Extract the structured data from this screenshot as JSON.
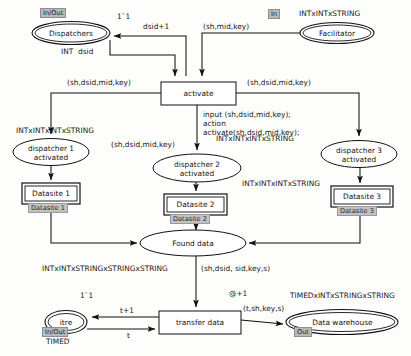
{
  "diagram": {
    "type": "colored-petri-net"
  },
  "places": [
    {
      "id": "dispatchers",
      "label": "Dispatchers",
      "port_tag": "In/Out",
      "color_set": "INT",
      "marking": "1`1",
      "variable": "dsid"
    },
    {
      "id": "facilitator",
      "label": "Facilitator",
      "port_tag": "In",
      "color_set": "INTxINTxSTRING"
    },
    {
      "id": "dispatcher1",
      "label": "dispatcher 1\nactivated",
      "color_set": "INTxINTxINTxSTRING"
    },
    {
      "id": "dispatcher2",
      "label": "dispatcher 2\nactivated",
      "color_set": "INTxINTxINTxSTRING"
    },
    {
      "id": "dispatcher3",
      "label": "dispatcher 3\nactivated",
      "color_set": "INTxINTxINTxSTRING"
    },
    {
      "id": "founddata",
      "label": "Found data",
      "color_set": "INTxINTxSTRINGxSTRINGxSTRING"
    },
    {
      "id": "itre",
      "label": "itre",
      "port_tag": "In/Out",
      "color_set": "TIMED",
      "marking": "1`1"
    },
    {
      "id": "warehouse",
      "label": "Data warehouse",
      "port_tag": "Out",
      "color_set": "TIMEDxINTxSTRINGxSTRING"
    }
  ],
  "transitions": [
    {
      "id": "activate",
      "label": "activate",
      "code": "input (sh,dsid,mid,key);\naction\nactivate(sh,dsid,mid,key);"
    },
    {
      "id": "transfer",
      "label": "transfer data",
      "time_delay": "@+1"
    }
  ],
  "substitution_transitions": [
    {
      "id": "datasite1",
      "label": "Datasite 1",
      "subpage": "Datasite 1"
    },
    {
      "id": "datasite2",
      "label": "Datasite 2",
      "subpage": "Datasite 2"
    },
    {
      "id": "datasite3",
      "label": "Datasite 3",
      "subpage": "Datasite 3"
    }
  ],
  "arc_labels": {
    "dsid_plus_1": "dsid+1",
    "int_dsid": "INT  dsid",
    "sh_mid_key": "(sh,mid,key)",
    "left_tuple": "(sh,dsid,mid,key)",
    "right_tuple": "(sh,dsid,mid,key)",
    "mid_tuple": "(sh,dsid,mid,key)",
    "found_tuple": "(sh,dsid, sid,key,s)",
    "t_plus_1": "t+1",
    "t": "t",
    "warehouse_tuple": "(t,sh,key,s)"
  },
  "color_labels": {
    "facilitator_cs": "INTxINTxSTRING",
    "dispatcher1_cs": "INTxINTxINTxSTRING",
    "dispatcher2_cs": "INTxINTxINTxSTRING",
    "dispatcher3_cs": "INTxINTxINTxSTRING",
    "founddata_cs": "INTxINTxSTRINGxSTRINGxSTRING",
    "warehouse_cs": "TIMEDxINTxSTRINGxSTRING",
    "itre_cs": "TIMED",
    "dispatchers_cs": "INT  dsid"
  },
  "markings": {
    "dispatchers": "1`1",
    "itre": "1`1"
  },
  "tags": {
    "in_out": "In/Out",
    "in": "In",
    "out": "Out"
  },
  "colors": {
    "stroke": "#111111",
    "background": "#fdfdfc",
    "tag_fill": "#b9b9b9",
    "text": "#161616"
  }
}
